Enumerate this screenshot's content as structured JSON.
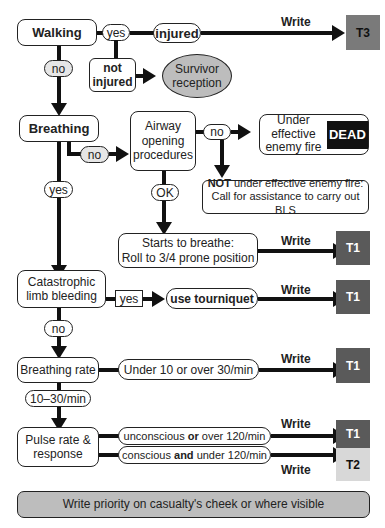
{
  "nodes": {
    "walking": "Walking",
    "yes1": "yes",
    "injured": "injured",
    "not_injured_1": "not",
    "not_injured_2": "injured",
    "survivor_1": "Survivor",
    "survivor_2": "reception",
    "combat_1": "Or if in combat",
    "combat_2": "return to",
    "combat_3": "fighting force",
    "no1": "no",
    "breathing": "Breathing",
    "no2": "no",
    "airway_1": "Airway",
    "airway_2": "opening",
    "airway_3": "procedures",
    "no3": "no",
    "under_fire_1": "Under",
    "under_fire_2": "effective",
    "under_fire_3": "enemy fire",
    "dead": "DEAD",
    "not_fire_bold": "NOT",
    "not_fire_1": " under effective enemy fire:",
    "not_fire_2": "Call for assistance to carry out BLS",
    "ok": "OK",
    "yes2": "yes",
    "starts_1": "Starts to breathe:",
    "starts_2": "Roll to 3/4 prone position",
    "catastrophic_1": "Catastrophic",
    "catastrophic_2": "limb bleeding",
    "yes3": "yes",
    "tourniquet": "use tourniquet",
    "no4": "no",
    "breathing_rate": "Breathing rate",
    "rate_abnormal": "Under 10 or over 30/min",
    "rate_normal": "10–30/min",
    "pulse_1": "Pulse rate &",
    "pulse_2": "response",
    "uncon_a": "unconscious ",
    "uncon_b": "or",
    "uncon_c": " over 120/min",
    "con_a": "conscious ",
    "con_b": "and",
    "con_c": " under 120/min",
    "footer": "Write priority on casualty's cheek or where visible"
  },
  "write_label": "Write",
  "tags": {
    "t3": "T3",
    "t1_a": "T1",
    "t1_b": "T1",
    "t1_c": "T1",
    "t1_d": "T1",
    "t2": "T2"
  },
  "colors": {
    "t3": "#7a7a7a",
    "t1": "#5a5a5a",
    "t2": "#d8d8d8",
    "dead": "#111111",
    "grey_fill": "#bdbdbd",
    "light_fill": "#e6e6e6"
  }
}
